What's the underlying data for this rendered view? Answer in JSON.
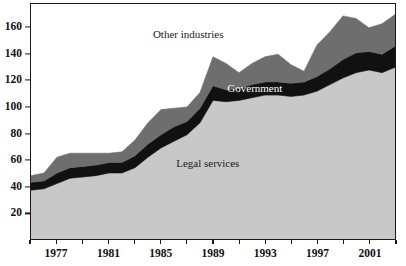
{
  "chart_data": {
    "type": "area",
    "stacked": true,
    "title": "",
    "subtitle": "",
    "xlabel": "",
    "ylabel": "",
    "xlim": [
      1975,
      2003
    ],
    "ylim": [
      0,
      178
    ],
    "grid": false,
    "legend_position": "inline-annotations",
    "x": [
      1975,
      1976,
      1977,
      1978,
      1979,
      1980,
      1981,
      1982,
      1983,
      1984,
      1985,
      1986,
      1987,
      1988,
      1989,
      1990,
      1991,
      1992,
      1993,
      1994,
      1995,
      1996,
      1997,
      1998,
      1999,
      2000,
      2001,
      2002,
      2003
    ],
    "series": [
      {
        "name": "Legal services",
        "color": "#c8c8c8",
        "values": [
          37,
          38,
          42,
          46,
          47,
          48,
          50,
          50,
          54,
          62,
          69,
          74,
          79,
          88,
          105,
          104,
          105,
          107,
          109,
          109,
          108,
          109,
          112,
          117,
          122,
          126,
          128,
          126,
          130
        ]
      },
      {
        "name": "Government",
        "color": "#111111",
        "values": [
          6,
          6,
          8,
          8,
          8,
          8,
          8,
          8,
          9,
          10,
          10,
          11,
          10,
          11,
          11,
          9,
          9,
          10,
          10,
          10,
          10,
          10,
          11,
          12,
          14,
          15,
          14,
          14,
          16
        ]
      },
      {
        "name": "Other industries",
        "color": "#6e6e6e",
        "values": [
          5,
          6,
          12,
          11,
          10,
          9,
          7,
          8,
          12,
          16,
          19,
          14,
          11,
          12,
          22,
          20,
          12,
          16,
          19,
          21,
          14,
          8,
          24,
          28,
          33,
          26,
          18,
          23,
          24
        ]
      }
    ],
    "totals": [
      48,
      50,
      62,
      65,
      65,
      65,
      65,
      66,
      75,
      88,
      98,
      99,
      100,
      111,
      138,
      133,
      126,
      133,
      138,
      140,
      132,
      127,
      147,
      157,
      169,
      167,
      160,
      163,
      170
    ],
    "y_ticks": [
      20,
      40,
      60,
      80,
      100,
      120,
      140,
      160
    ],
    "y_tick_labels": [
      "20",
      "40",
      "60",
      "80",
      "100",
      "120",
      "140",
      "160"
    ],
    "x_major_ticks": [
      1977,
      1981,
      1985,
      1989,
      1993,
      1997,
      2001
    ],
    "x_major_tick_labels": [
      "1977",
      "1981",
      "1985",
      "1989",
      "1993",
      "1997",
      "2001"
    ],
    "x_minor_ticks": [
      1975,
      1979,
      1983,
      1987,
      1991,
      1995,
      1999,
      2003
    ],
    "annotations": [
      {
        "name": "other-industries",
        "text": "Other industries",
        "x": 1987.1,
        "y": 155,
        "style": "dark"
      },
      {
        "name": "government",
        "text": "Government",
        "x": 1992.2,
        "y": 114,
        "style": "light"
      },
      {
        "name": "legal-services",
        "text": "Legal services",
        "x": 1988.6,
        "y": 58,
        "style": "dark"
      }
    ]
  }
}
